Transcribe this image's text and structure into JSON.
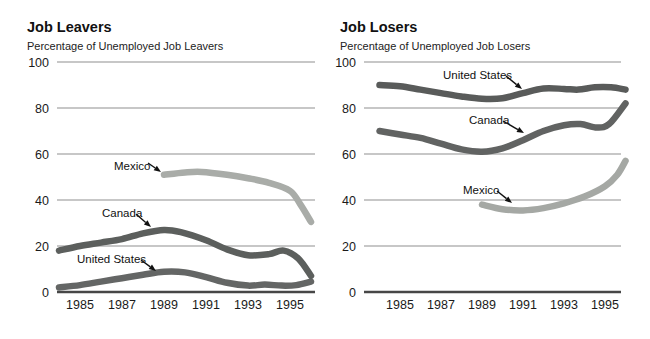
{
  "page": {
    "background": "#ffffff"
  },
  "chart_data": [
    {
      "type": "line",
      "title": "Job Leavers",
      "subtitle": "Percentage of Unemployed Job Leavers",
      "xlabel": "",
      "ylabel": "",
      "ylim": [
        0,
        100
      ],
      "x_range": [
        1984,
        1996
      ],
      "y_ticks": [
        0,
        20,
        40,
        60,
        80,
        100
      ],
      "x_ticks": [
        1985,
        1987,
        1989,
        1991,
        1993,
        1995
      ],
      "grid": "horizontal",
      "legend_position": "inline-annotations",
      "series": [
        {
          "name": "Mexico",
          "color": "#a9aca8",
          "points": [
            [
              1989,
              51
            ],
            [
              1990,
              52
            ],
            [
              1990.8,
              52.2
            ],
            [
              1992,
              51
            ],
            [
              1993,
              49.5
            ],
            [
              1994,
              47.5
            ],
            [
              1995,
              44
            ],
            [
              1995.5,
              38
            ],
            [
              1996,
              30.5
            ]
          ]
        },
        {
          "name": "United States",
          "color": "#646665",
          "points": [
            [
              1984,
              2
            ],
            [
              1985,
              3
            ],
            [
              1986,
              4.5
            ],
            [
              1987,
              6
            ],
            [
              1988,
              7.5
            ],
            [
              1989,
              8.8
            ],
            [
              1990,
              8.5
            ],
            [
              1991,
              6.5
            ],
            [
              1992,
              4
            ],
            [
              1993,
              2.8
            ],
            [
              1993.8,
              3.2
            ],
            [
              1994.6,
              2.8
            ],
            [
              1995.3,
              3
            ],
            [
              1996,
              4.5
            ]
          ]
        },
        {
          "name": "Canada",
          "color": "#5c5f5d",
          "points": [
            [
              1984,
              18
            ],
            [
              1985,
              20
            ],
            [
              1986,
              21.5
            ],
            [
              1987,
              23
            ],
            [
              1988,
              25.5
            ],
            [
              1989,
              27
            ],
            [
              1989.8,
              26
            ],
            [
              1991,
              22.5
            ],
            [
              1992,
              18.5
            ],
            [
              1993,
              16
            ],
            [
              1994,
              16.5
            ],
            [
              1994.7,
              18
            ],
            [
              1995.4,
              14.5
            ],
            [
              1996,
              7
            ]
          ]
        }
      ],
      "annotations": [
        {
          "text": "Mexico",
          "tx": 114,
          "ty": 170,
          "x1": 148,
          "y1": 163,
          "x2": 161,
          "y2": 172
        },
        {
          "text": "Canada",
          "tx": 102,
          "ty": 217,
          "x1": 136,
          "y1": 214,
          "x2": 151,
          "y2": 227
        },
        {
          "text": "United States",
          "tx": 77,
          "ty": 263,
          "x1": 141,
          "y1": 260,
          "x2": 156,
          "y2": 271
        }
      ]
    },
    {
      "type": "line",
      "title": "Job Losers",
      "subtitle": "Percentage of Unemployed Job Losers",
      "xlabel": "",
      "ylabel": "",
      "ylim": [
        0,
        100
      ],
      "x_range": [
        1984,
        1996
      ],
      "y_ticks": [
        0,
        20,
        40,
        60,
        80,
        100
      ],
      "x_ticks": [
        1985,
        1987,
        1989,
        1991,
        1993,
        1995
      ],
      "grid": "horizontal",
      "legend_position": "inline-annotations",
      "series": [
        {
          "name": "United States",
          "color": "#595b5a",
          "points": [
            [
              1984,
              90
            ],
            [
              1985,
              89.5
            ],
            [
              1986,
              88
            ],
            [
              1987,
              86.5
            ],
            [
              1988,
              85
            ],
            [
              1989,
              84
            ],
            [
              1990,
              84.2
            ],
            [
              1991,
              86.5
            ],
            [
              1992,
              88.5
            ],
            [
              1993,
              88.3
            ],
            [
              1993.7,
              88
            ],
            [
              1994.5,
              89
            ],
            [
              1995.3,
              89
            ],
            [
              1996,
              88
            ]
          ]
        },
        {
          "name": "Canada",
          "color": "#616362",
          "points": [
            [
              1984,
              70
            ],
            [
              1985,
              68.5
            ],
            [
              1986,
              67
            ],
            [
              1987,
              64.5
            ],
            [
              1988,
              62
            ],
            [
              1989,
              61
            ],
            [
              1990,
              62.5
            ],
            [
              1991,
              66
            ],
            [
              1992,
              70
            ],
            [
              1993,
              72.5
            ],
            [
              1993.8,
              73
            ],
            [
              1994.6,
              71.5
            ],
            [
              1995.2,
              73
            ],
            [
              1996,
              82
            ]
          ]
        },
        {
          "name": "Mexico",
          "color": "#a5a8a4",
          "points": [
            [
              1989,
              38
            ],
            [
              1990,
              36
            ],
            [
              1991,
              35.5
            ],
            [
              1992,
              36.5
            ],
            [
              1993,
              38.5
            ],
            [
              1994,
              41.5
            ],
            [
              1995,
              46
            ],
            [
              1995.6,
              51
            ],
            [
              1996,
              57
            ]
          ]
        }
      ],
      "annotations": [
        {
          "text": "United States",
          "tx": 443,
          "ty": 79,
          "x1": 506,
          "y1": 76,
          "x2": 522,
          "y2": 89
        },
        {
          "text": "Canada",
          "tx": 469,
          "ty": 124,
          "x1": 503,
          "y1": 121,
          "x2": 524,
          "y2": 133
        },
        {
          "text": "Mexico",
          "tx": 463,
          "ty": 194,
          "x1": 497,
          "y1": 191,
          "x2": 512,
          "y2": 203
        }
      ]
    }
  ]
}
